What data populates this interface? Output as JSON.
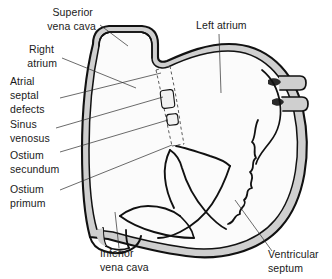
{
  "figure": {
    "width": 332,
    "height": 279,
    "background_color": "#ffffff"
  },
  "colors": {
    "outline": "#111111",
    "wall_fill": "#cfcfcf",
    "chamber_fill": "#fbfbfb",
    "text": "#1a1a1a",
    "leader_line": "#2b2b2b",
    "septum_dash": "#4a4a4a",
    "defect_fill": "#f2f2f2"
  },
  "labels": {
    "superior_vena_cava": {
      "lines": [
        "Superior",
        "vena cava"
      ],
      "align": "right",
      "x": 96,
      "y": 16
    },
    "right_atrium": {
      "lines": [
        "Right",
        "atrium"
      ],
      "align": "right",
      "x": 57,
      "y": 53
    },
    "atrial_septal_defects": {
      "lines": [
        "Atrial",
        "septal",
        "defects"
      ],
      "align": "left",
      "x": 10,
      "y": 85
    },
    "sinus_venosus": {
      "lines": [
        "Sinus",
        "venosus"
      ],
      "align": "left",
      "x": 10,
      "y": 128
    },
    "ostium_secundum": {
      "lines": [
        "Ostium",
        "secundum"
      ],
      "align": "left",
      "x": 10,
      "y": 159
    },
    "ostium_primum": {
      "lines": [
        "Ostium",
        "primum"
      ],
      "align": "left",
      "x": 10,
      "y": 193
    },
    "left_atrium": {
      "lines": [
        "Left atrium"
      ],
      "align": "left",
      "x": 196,
      "y": 29
    },
    "inferior_vena_cava": {
      "lines": [
        "Inferior",
        "vena cava"
      ],
      "align": "left",
      "x": 100,
      "y": 257
    },
    "ventricular_septum": {
      "lines": [
        "Ventricular",
        "septum"
      ],
      "align": "left",
      "x": 268,
      "y": 258
    }
  },
  "structures": {
    "superior_vena_cava": "Superior vena cava",
    "right_atrium": "Right atrium",
    "left_atrium": "Left atrium",
    "inferior_vena_cava": "Inferior vena cava",
    "ventricular_septum": "Ventricular septum",
    "interatrial_septum": "Interatrial septum (dashed)",
    "pulmonary_veins": "Pulmonary veins",
    "mitral_valve": "Mitral valve leaflets",
    "tricuspid_valve": "Tricuspid valve leaflet"
  },
  "defects": [
    {
      "name": "sinus venosus defect",
      "position": "upper interatrial septum",
      "x": 163,
      "y": 92,
      "width": 12,
      "height": 16
    },
    {
      "name": "ostium secundum defect",
      "position": "mid interatrial septum",
      "x": 168,
      "y": 116,
      "width": 10,
      "height": 10
    }
  ]
}
